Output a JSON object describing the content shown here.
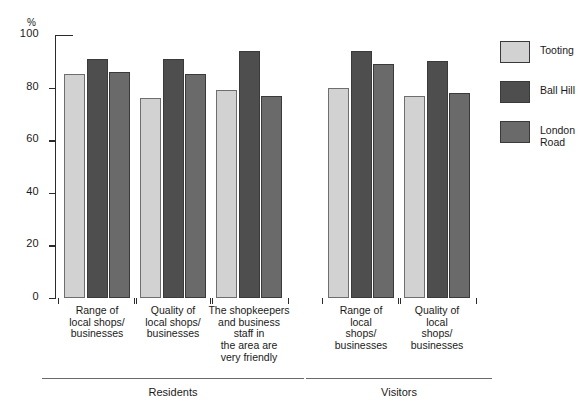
{
  "figure": {
    "clipped_title_remnant": "",
    "axis_unit_label": "%"
  },
  "legend": {
    "items": [
      {
        "label": "Tooting",
        "color": "#d2d2d2",
        "swatch_name": "legend-swatch-tooting"
      },
      {
        "label": "Ball Hill",
        "color": "#4e4e4e",
        "swatch_name": "legend-swatch-ball-hill"
      },
      {
        "label": "London\nRoad",
        "color": "#6a6a6a",
        "swatch_name": "legend-swatch-london-road"
      }
    ]
  },
  "groups": [
    {
      "label": "Residents"
    },
    {
      "label": "Visitors"
    }
  ],
  "yticks": [
    "0",
    "20",
    "40",
    "60",
    "80",
    "100"
  ],
  "chart_data": {
    "type": "bar",
    "title": "",
    "xlabel": "",
    "ylabel": "%",
    "ylim": [
      0,
      100
    ],
    "yticks": [
      0,
      20,
      40,
      60,
      80,
      100
    ],
    "grid": false,
    "legend_position": "right",
    "group_labels": [
      "Residents",
      "Visitors"
    ],
    "categories": [
      {
        "group": "Residents",
        "label": "Range of\nlocal shops/\nbusinesses"
      },
      {
        "group": "Residents",
        "label": "Quality of\nlocal shops/\nbusinesses"
      },
      {
        "group": "Residents",
        "label": "The shopkeepers\nand business\nstaff in\nthe area are\nvery friendly"
      },
      {
        "group": "Visitors",
        "label": "Range of\nlocal\nshops/\nbusinesses"
      },
      {
        "group": "Visitors",
        "label": "Quality of\nlocal\nshops/\nbusinesses"
      }
    ],
    "series": [
      {
        "name": "Tooting",
        "color": "#d2d2d2",
        "values": [
          85,
          76,
          79,
          80,
          77
        ]
      },
      {
        "name": "Ball Hill",
        "color": "#4e4e4e",
        "values": [
          91,
          91,
          94,
          94,
          90
        ]
      },
      {
        "name": "London Road",
        "color": "#6a6a6a",
        "values": [
          86,
          85,
          77,
          89,
          78
        ]
      }
    ]
  }
}
